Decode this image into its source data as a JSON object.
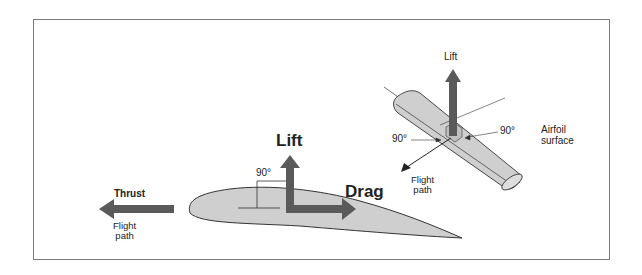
{
  "diagram": {
    "main": {
      "lift_label": "Lift",
      "drag_label": "Drag",
      "thrust_label": "Thrust",
      "angle_label": "90°",
      "flight_path_line1": "Flight",
      "flight_path_line2": "path"
    },
    "inset": {
      "lift_label": "Lift",
      "angle_left_label": "90°",
      "angle_right_label": "90°",
      "airfoil_surface_line1": "Airfoil",
      "airfoil_surface_line2": "surface",
      "flight_path_line1": "Flight",
      "flight_path_line2": "path"
    },
    "colors": {
      "arrow": "#5a5a5a",
      "airfoil_fill": "#cfcfcf",
      "outline": "#333333",
      "frame": "#7a7a7a"
    }
  }
}
